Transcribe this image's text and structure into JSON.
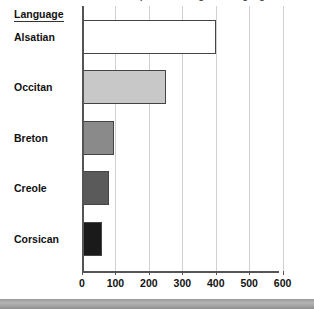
{
  "title_clipped": "Estimated number of speakers of regional languages",
  "row_header": "Language",
  "chart_data": {
    "type": "bar",
    "orientation": "horizontal",
    "title": "",
    "xlabel": "",
    "ylabel": "Language",
    "categories": [
      "Alsatian",
      "Occitan",
      "Breton",
      "Creole",
      "Corsican"
    ],
    "values": [
      400,
      250,
      95,
      80,
      60
    ],
    "xlim": [
      0,
      640
    ],
    "xticks": [
      0,
      100,
      200,
      300,
      400,
      500,
      600
    ],
    "xtick_labels": [
      "0",
      "100",
      "200",
      "300",
      "400",
      "500",
      "600"
    ],
    "grid": "vertical",
    "legend": "none",
    "bar_colors": [
      "#ffffff",
      "#c8c8c8",
      "#8a8a8a",
      "#5a5a5a",
      "#1a1a1a"
    ],
    "bar_border_color": "#444444",
    "series": [
      {
        "name": "Speakers",
        "values": [
          400,
          250,
          95,
          80,
          60
        ]
      }
    ]
  },
  "colors": {
    "gridline": "#d0d0d0",
    "axis": "#555555",
    "text": "#111111",
    "band": "#9a9a9a"
  }
}
